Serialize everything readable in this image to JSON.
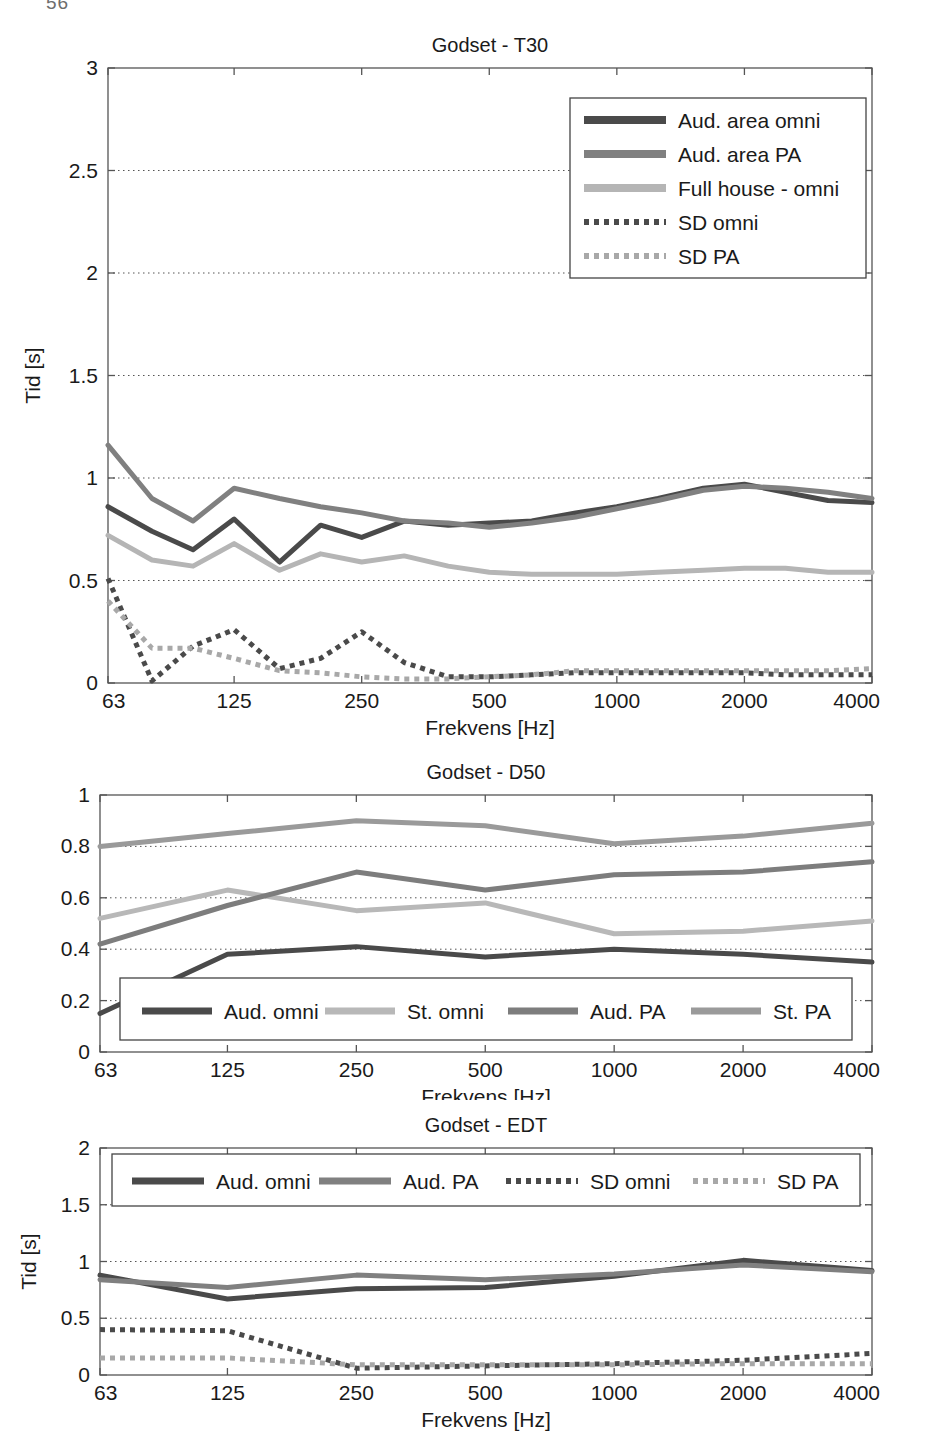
{
  "page": {
    "number": "56"
  },
  "figures": [
    {
      "id": "fig-t30",
      "chart_data": {
        "type": "line",
        "title": "Godset - T30",
        "xlabel": "Frekvens [Hz]",
        "ylabel": "Tid [s]",
        "xscale": "log",
        "xlim": [
          63,
          4000
        ],
        "ylim": [
          0,
          3
        ],
        "yticks": [
          0,
          0.5,
          1,
          1.5,
          2,
          2.5,
          3
        ],
        "ytick_labels": [
          "0",
          "0.5",
          "1",
          "1.5",
          "2",
          "2.5",
          "3"
        ],
        "xticks": [
          63,
          125,
          250,
          500,
          1000,
          2000,
          4000
        ],
        "xtick_labels": [
          "63",
          "125",
          "250",
          "500",
          "1000",
          "2000",
          "4000"
        ],
        "grid": true,
        "legend_position": "top-right",
        "x": [
          63,
          80,
          100,
          125,
          160,
          200,
          250,
          315,
          400,
          500,
          630,
          800,
          1000,
          1250,
          1600,
          2000,
          2500,
          3150,
          4000
        ],
        "series": [
          {
            "name": "Aud. area omni",
            "style": "solid",
            "color": "#4a4a4a",
            "values": [
              0.86,
              0.74,
              0.65,
              0.8,
              0.59,
              0.77,
              0.71,
              0.79,
              0.77,
              0.78,
              0.79,
              0.83,
              0.86,
              0.9,
              0.95,
              0.97,
              0.93,
              0.89,
              0.88
            ]
          },
          {
            "name": "Aud. area PA",
            "style": "solid",
            "color": "#808080",
            "values": [
              1.16,
              0.9,
              0.79,
              0.95,
              0.9,
              0.86,
              0.83,
              0.79,
              0.78,
              0.76,
              0.78,
              0.81,
              0.85,
              0.89,
              0.94,
              0.96,
              0.95,
              0.93,
              0.9
            ]
          },
          {
            "name": "Full house - omni",
            "style": "solid",
            "color": "#b5b5b5",
            "values": [
              0.72,
              0.6,
              0.57,
              0.68,
              0.55,
              0.63,
              0.59,
              0.62,
              0.57,
              0.54,
              0.53,
              0.53,
              0.53,
              0.54,
              0.55,
              0.56,
              0.56,
              0.54,
              0.54
            ]
          },
          {
            "name": "SD omni",
            "style": "dotted",
            "color": "#4a4a4a",
            "values": [
              0.51,
              0.01,
              0.18,
              0.26,
              0.07,
              0.12,
              0.25,
              0.1,
              0.03,
              0.03,
              0.04,
              0.05,
              0.05,
              0.05,
              0.05,
              0.05,
              0.04,
              0.04,
              0.04
            ]
          },
          {
            "name": "SD PA",
            "style": "dotted",
            "color": "#a8a8a8",
            "values": [
              0.4,
              0.17,
              0.17,
              0.12,
              0.06,
              0.05,
              0.03,
              0.02,
              0.02,
              0.03,
              0.04,
              0.06,
              0.06,
              0.06,
              0.06,
              0.06,
              0.06,
              0.06,
              0.07
            ]
          }
        ]
      }
    },
    {
      "id": "fig-d50",
      "chart_data": {
        "type": "line",
        "title": "Godset - D50",
        "xlabel": "Frekvens [Hz]",
        "ylabel": "",
        "xscale": "log",
        "xlim": [
          63,
          4000
        ],
        "ylim": [
          0,
          1
        ],
        "yticks": [
          0,
          0.2,
          0.4,
          0.6,
          0.8,
          1
        ],
        "ytick_labels": [
          "0",
          "0.2",
          "0.4",
          "0.6",
          "0.8",
          "1"
        ],
        "xticks": [
          63,
          125,
          250,
          500,
          1000,
          2000,
          4000
        ],
        "xtick_labels": [
          "63",
          "125",
          "250",
          "500",
          "1000",
          "2000",
          "4000"
        ],
        "grid": true,
        "legend_position": "bottom-inside",
        "x": [
          63,
          125,
          250,
          500,
          1000,
          2000,
          4000
        ],
        "series": [
          {
            "name": "Aud. omni",
            "style": "solid",
            "color": "#4a4a4a",
            "values": [
              0.15,
              0.38,
              0.41,
              0.37,
              0.4,
              0.38,
              0.35
            ]
          },
          {
            "name": "St. omni",
            "style": "solid",
            "color": "#b8b8b8",
            "values": [
              0.52,
              0.63,
              0.55,
              0.58,
              0.46,
              0.47,
              0.51
            ]
          },
          {
            "name": "Aud. PA",
            "style": "solid",
            "color": "#7d7d7d",
            "values": [
              0.42,
              0.57,
              0.7,
              0.63,
              0.69,
              0.7,
              0.74
            ]
          },
          {
            "name": "St. PA",
            "style": "solid",
            "color": "#9a9a9a",
            "values": [
              0.8,
              0.85,
              0.9,
              0.88,
              0.81,
              0.84,
              0.89
            ]
          }
        ]
      }
    },
    {
      "id": "fig-edt",
      "chart_data": {
        "type": "line",
        "title": "Godset - EDT",
        "xlabel": "Frekvens [Hz]",
        "ylabel": "Tid [s]",
        "xscale": "log",
        "xlim": [
          63,
          4000
        ],
        "ylim": [
          0,
          2
        ],
        "yticks": [
          0,
          0.5,
          1,
          1.5,
          2
        ],
        "ytick_labels": [
          "0",
          "0.5",
          "1",
          "1.5",
          "2"
        ],
        "xticks": [
          63,
          125,
          250,
          500,
          1000,
          2000,
          4000
        ],
        "xtick_labels": [
          "63",
          "125",
          "250",
          "500",
          "1000",
          "2000",
          "4000"
        ],
        "grid": true,
        "legend_position": "top-inside",
        "x": [
          63,
          125,
          250,
          500,
          1000,
          2000,
          4000
        ],
        "series": [
          {
            "name": "Aud. omni",
            "style": "solid",
            "color": "#4a4a4a",
            "values": [
              0.88,
              0.67,
              0.76,
              0.77,
              0.87,
              1.01,
              0.92
            ]
          },
          {
            "name": "Aud. PA",
            "style": "solid",
            "color": "#808080",
            "values": [
              0.84,
              0.77,
              0.88,
              0.84,
              0.89,
              0.97,
              0.91
            ]
          },
          {
            "name": "SD omni",
            "style": "dotted",
            "color": "#4a4a4a",
            "values": [
              0.4,
              0.39,
              0.06,
              0.08,
              0.1,
              0.13,
              0.19
            ]
          },
          {
            "name": "SD PA",
            "style": "dotted",
            "color": "#a8a8a8",
            "values": [
              0.15,
              0.15,
              0.09,
              0.09,
              0.09,
              0.1,
              0.1
            ]
          }
        ]
      }
    }
  ]
}
